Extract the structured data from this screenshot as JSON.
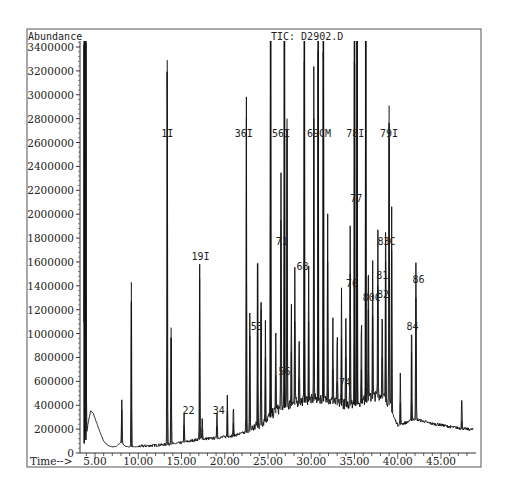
{
  "chart_data": {
    "type": "line",
    "title": "TIC: D2902.D",
    "ylabel": "Abundance",
    "xlabel": "Time-->",
    "xlim": [
      3.0,
      49.5
    ],
    "ylim": [
      0,
      3500000
    ],
    "x_ticks": [
      5,
      10,
      15,
      20,
      25,
      30,
      35,
      40,
      45
    ],
    "x_tick_labels": [
      "5.00",
      "10.00",
      "15.00",
      "20.00",
      "25.00",
      "30.00",
      "35.00",
      "40.00",
      "45.00"
    ],
    "y_ticks": [
      0,
      200000,
      400000,
      600000,
      800000,
      1000000,
      1200000,
      1400000,
      1600000,
      1800000,
      2000000,
      2200000,
      2400000,
      2600000,
      2800000,
      3000000,
      3200000,
      3400000
    ],
    "y_tick_labels": [
      "0",
      "200000",
      "400000",
      "600000",
      "800000",
      "1000000",
      "1200000",
      "1400000",
      "1600000",
      "1800000",
      "2000000",
      "2200000",
      "2400000",
      "2600000",
      "2800000",
      "3000000",
      "3200000",
      "3400000"
    ],
    "grid": false,
    "baseline": [
      [
        3.9,
        80000
      ],
      [
        4.2,
        250000
      ],
      [
        4.5,
        350000
      ],
      [
        4.8,
        330000
      ],
      [
        5.2,
        250000
      ],
      [
        5.6,
        170000
      ],
      [
        6.0,
        100000
      ],
      [
        6.5,
        60000
      ],
      [
        7.0,
        50000
      ],
      [
        7.5,
        55000
      ],
      [
        8.0,
        90000
      ],
      [
        8.5,
        55000
      ],
      [
        9.0,
        50000
      ],
      [
        10.0,
        50000
      ],
      [
        11.0,
        55000
      ],
      [
        12.0,
        60000
      ],
      [
        13.0,
        65000
      ],
      [
        14.0,
        70000
      ],
      [
        15.0,
        80000
      ],
      [
        16.0,
        95000
      ],
      [
        17.0,
        110000
      ],
      [
        18.0,
        115000
      ],
      [
        19.0,
        120000
      ],
      [
        20.0,
        130000
      ],
      [
        21.0,
        140000
      ],
      [
        22.0,
        160000
      ],
      [
        23.0,
        180000
      ],
      [
        24.0,
        220000
      ],
      [
        25.0,
        280000
      ],
      [
        26.0,
        340000
      ],
      [
        27.0,
        380000
      ],
      [
        28.0,
        400000
      ],
      [
        29.0,
        420000
      ],
      [
        30.0,
        430000
      ],
      [
        31.0,
        440000
      ],
      [
        32.0,
        420000
      ],
      [
        33.0,
        400000
      ],
      [
        34.0,
        390000
      ],
      [
        35.0,
        400000
      ],
      [
        36.0,
        420000
      ],
      [
        37.0,
        450000
      ],
      [
        38.0,
        470000
      ],
      [
        39.0,
        400000
      ],
      [
        39.5,
        300000
      ],
      [
        40.0,
        230000
      ],
      [
        41.0,
        250000
      ],
      [
        42.0,
        280000
      ],
      [
        43.0,
        260000
      ],
      [
        44.0,
        240000
      ],
      [
        45.0,
        230000
      ],
      [
        46.0,
        215000
      ],
      [
        47.0,
        205000
      ],
      [
        48.0,
        195000
      ],
      [
        48.7,
        190000
      ]
    ],
    "peaks": [
      {
        "t": 3.75,
        "h": 3500000
      },
      {
        "t": 3.95,
        "h": 3500000
      },
      {
        "t": 8.1,
        "h": 360000
      },
      {
        "t": 9.2,
        "h": 1430000
      },
      {
        "t": 13.35,
        "h": 3290000
      },
      {
        "t": 13.8,
        "h": 1050000
      },
      {
        "t": 15.3,
        "h": 230000
      },
      {
        "t": 17.1,
        "h": 1460000
      },
      {
        "t": 17.4,
        "h": 200000
      },
      {
        "t": 19.1,
        "h": 220000
      },
      {
        "t": 20.3,
        "h": 350000
      },
      {
        "t": 21.0,
        "h": 250000
      },
      {
        "t": 22.5,
        "h": 2800000
      },
      {
        "t": 22.9,
        "h": 980000
      },
      {
        "t": 23.8,
        "h": 1580000
      },
      {
        "t": 24.2,
        "h": 1200000
      },
      {
        "t": 24.7,
        "h": 800000
      },
      {
        "t": 25.3,
        "h": 3500000
      },
      {
        "t": 25.9,
        "h": 650000
      },
      {
        "t": 26.5,
        "h": 1950000
      },
      {
        "t": 26.9,
        "h": 3500000
      },
      {
        "t": 27.2,
        "h": 2800000
      },
      {
        "t": 27.7,
        "h": 850000
      },
      {
        "t": 28.1,
        "h": 1100000
      },
      {
        "t": 28.6,
        "h": 620000
      },
      {
        "t": 29.2,
        "h": 3500000
      },
      {
        "t": 29.7,
        "h": 1100000
      },
      {
        "t": 30.3,
        "h": 2800000
      },
      {
        "t": 30.8,
        "h": 3500000
      },
      {
        "t": 31.4,
        "h": 3500000
      },
      {
        "t": 31.9,
        "h": 1600000
      },
      {
        "t": 32.5,
        "h": 700000
      },
      {
        "t": 33.0,
        "h": 600000
      },
      {
        "t": 33.5,
        "h": 960000
      },
      {
        "t": 34.0,
        "h": 800000
      },
      {
        "t": 34.5,
        "h": 1500000
      },
      {
        "t": 35.0,
        "h": 3500000
      },
      {
        "t": 35.3,
        "h": 3500000
      },
      {
        "t": 35.8,
        "h": 700000
      },
      {
        "t": 36.3,
        "h": 3500000
      },
      {
        "t": 36.6,
        "h": 1200000
      },
      {
        "t": 37.1,
        "h": 1150000
      },
      {
        "t": 37.7,
        "h": 1400000
      },
      {
        "t": 38.2,
        "h": 800000
      },
      {
        "t": 38.6,
        "h": 1600000
      },
      {
        "t": 39.0,
        "h": 2910000
      },
      {
        "t": 39.3,
        "h": 1700000
      },
      {
        "t": 40.3,
        "h": 420000
      },
      {
        "t": 41.6,
        "h": 840000
      },
      {
        "t": 42.1,
        "h": 1300000
      },
      {
        "t": 47.4,
        "h": 270000
      }
    ],
    "annotations": [
      {
        "label": "1I",
        "t": 13.35,
        "y": 2650000
      },
      {
        "label": "19I",
        "t": 17.2,
        "y": 1620000
      },
      {
        "label": "22",
        "t": 15.8,
        "y": 330000
      },
      {
        "label": "34",
        "t": 19.3,
        "y": 330000
      },
      {
        "label": "36I",
        "t": 22.2,
        "y": 2650000
      },
      {
        "label": "53",
        "t": 23.7,
        "y": 1030000
      },
      {
        "label": "56I",
        "t": 26.5,
        "y": 2650000
      },
      {
        "label": "56",
        "t": 26.9,
        "y": 650000
      },
      {
        "label": "71",
        "t": 26.6,
        "y": 1740000
      },
      {
        "label": "68",
        "t": 29.0,
        "y": 1530000
      },
      {
        "label": "69CM",
        "t": 30.9,
        "y": 2650000
      },
      {
        "label": "74",
        "t": 33.9,
        "y": 560000
      },
      {
        "label": "76",
        "t": 34.7,
        "y": 1390000
      },
      {
        "label": "77",
        "t": 35.2,
        "y": 2100000
      },
      {
        "label": "78I",
        "t": 35.1,
        "y": 2650000
      },
      {
        "label": "79I",
        "t": 39.0,
        "y": 2650000
      },
      {
        "label": "80C",
        "t": 37.0,
        "y": 1270000
      },
      {
        "label": "81",
        "t": 38.2,
        "y": 1460000
      },
      {
        "label": "82",
        "t": 38.3,
        "y": 1300000
      },
      {
        "label": "83C",
        "t": 38.7,
        "y": 1740000
      },
      {
        "label": "84",
        "t": 41.7,
        "y": 1030000
      },
      {
        "label": "86",
        "t": 42.4,
        "y": 1420000
      }
    ]
  }
}
